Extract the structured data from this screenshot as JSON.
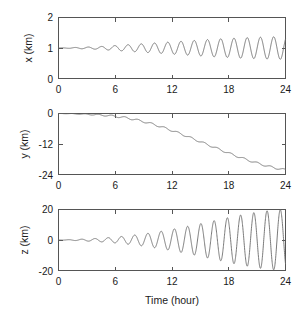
{
  "figure": {
    "background_color": "#ffffff",
    "line_color": "#6b6b6b",
    "axis_color": "#555555",
    "panel_count": 3
  },
  "chart_data": [
    {
      "type": "line",
      "panel_index": 0,
      "title": "",
      "xlabel": "",
      "ylabel": "x (km)",
      "xlim": [
        0,
        24
      ],
      "ylim": [
        0,
        2
      ],
      "xticks": [
        0,
        6,
        12,
        18,
        24
      ],
      "xticklabels": [
        "0",
        "6",
        "12",
        "18",
        "24"
      ],
      "yticks": [
        0,
        1,
        2
      ],
      "yticklabels": [
        "0",
        "1",
        "2"
      ],
      "grid": false,
      "legend": null,
      "description": "Oscillation about x = 1 km with slowly growing amplitude; period about 1.4 hours, amplitude grows from near 0 at t=0 to about 0.35 km at t=24.",
      "series": [
        {
          "name": "x",
          "baseline": 1.0,
          "period_hours": 1.4,
          "amplitude_start": 0.0,
          "amplitude_end": 0.37,
          "growth": "exponential",
          "growth_rate": 0.155,
          "x": [
            0,
            1,
            2,
            3,
            4,
            5,
            6,
            7,
            8,
            9,
            10,
            11,
            12,
            13,
            14,
            15,
            16,
            17,
            18,
            19,
            20,
            21,
            22,
            23,
            24
          ],
          "envelope_upper": [
            1.0,
            1.01,
            1.02,
            1.03,
            1.04,
            1.06,
            1.08,
            1.1,
            1.12,
            1.14,
            1.16,
            1.18,
            1.2,
            1.22,
            1.24,
            1.26,
            1.28,
            1.3,
            1.31,
            1.33,
            1.34,
            1.35,
            1.36,
            1.37,
            1.37
          ],
          "envelope_lower": [
            1.0,
            0.99,
            0.98,
            0.97,
            0.96,
            0.94,
            0.92,
            0.9,
            0.88,
            0.86,
            0.84,
            0.82,
            0.8,
            0.78,
            0.76,
            0.74,
            0.72,
            0.7,
            0.69,
            0.67,
            0.66,
            0.65,
            0.64,
            0.63,
            0.63
          ]
        }
      ]
    },
    {
      "type": "line",
      "panel_index": 1,
      "title": "",
      "xlabel": "",
      "ylabel": "y (km)",
      "xlim": [
        0,
        24
      ],
      "ylim": [
        -24,
        0
      ],
      "xticks": [
        0,
        6,
        12,
        18,
        24
      ],
      "xticklabels": [
        "0",
        "6",
        "12",
        "18",
        "24"
      ],
      "yticks": [
        -24,
        -12,
        0
      ],
      "yticklabels": [
        "-24",
        "-12",
        "0"
      ],
      "grid": false,
      "legend": null,
      "description": "Monotonic accelerating decline from 0 km at t=0 to about -22 km at t=24, with small superimposed ripples of the same period as the x oscillation.",
      "series": [
        {
          "name": "y",
          "x": [
            0,
            1,
            2,
            3,
            4,
            5,
            6,
            7,
            8,
            9,
            10,
            11,
            12,
            13,
            14,
            15,
            16,
            17,
            18,
            19,
            20,
            21,
            22,
            23,
            24
          ],
          "values": [
            0.0,
            -0.05,
            -0.15,
            -0.3,
            -0.5,
            -0.75,
            -1.1,
            -1.6,
            -2.3,
            -3.2,
            -4.2,
            -5.4,
            -6.7,
            -8.1,
            -9.6,
            -11.1,
            -12.6,
            -14.1,
            -15.6,
            -17.0,
            -18.3,
            -19.5,
            -20.6,
            -21.5,
            -22.2
          ],
          "ripple_amplitude": 0.35
        }
      ]
    },
    {
      "type": "line",
      "panel_index": 2,
      "title": "",
      "xlabel": "Time (hour)",
      "ylabel": "z (km)",
      "xlim": [
        0,
        24
      ],
      "ylim": [
        -20,
        20
      ],
      "xticks": [
        0,
        6,
        12,
        18,
        24
      ],
      "xticklabels": [
        "0",
        "6",
        "12",
        "18",
        "24"
      ],
      "yticks": [
        -20,
        0,
        20
      ],
      "yticklabels": [
        "-20",
        "0",
        "20"
      ],
      "grid": false,
      "legend": null,
      "description": "Oscillation about z = 0 km with strongly growing amplitude; period about 1.4 hours, amplitude grows from near 0 at t=0 to about 20 km at t=24.",
      "series": [
        {
          "name": "z",
          "baseline": 0.0,
          "period_hours": 1.4,
          "amplitude_start": 0.0,
          "amplitude_end": 20.0,
          "growth": "exponential",
          "growth_rate": 0.2,
          "x": [
            0,
            1,
            2,
            3,
            4,
            5,
            6,
            7,
            8,
            9,
            10,
            11,
            12,
            13,
            14,
            15,
            16,
            17,
            18,
            19,
            20,
            21,
            22,
            23,
            24
          ],
          "envelope_upper": [
            0.0,
            0.2,
            0.4,
            0.7,
            1.0,
            1.4,
            1.9,
            2.5,
            3.2,
            4.0,
            4.9,
            5.9,
            7.0,
            8.2,
            9.4,
            10.7,
            12.1,
            13.4,
            14.8,
            16.1,
            17.2,
            18.3,
            19.1,
            19.7,
            20.0
          ],
          "envelope_lower": [
            0.0,
            -0.2,
            -0.4,
            -0.7,
            -1.0,
            -1.4,
            -1.9,
            -2.5,
            -3.2,
            -4.0,
            -4.9,
            -5.9,
            -7.0,
            -8.2,
            -9.4,
            -10.7,
            -12.1,
            -13.4,
            -14.8,
            -16.1,
            -17.2,
            -18.3,
            -19.1,
            -19.7,
            -20.0
          ]
        }
      ]
    }
  ],
  "panels": [
    {
      "name": "x-panel",
      "ylabel": "x (km)",
      "ytick_labels": [
        "2",
        "1",
        "0"
      ],
      "xtick_labels": [
        "0",
        "6",
        "12",
        "18",
        "24"
      ],
      "xlabel": ""
    },
    {
      "name": "y-panel",
      "ylabel": "y (km)",
      "ytick_labels": [
        "0",
        "-12",
        "-24"
      ],
      "xtick_labels": [
        "0",
        "6",
        "12",
        "18",
        "24"
      ],
      "xlabel": ""
    },
    {
      "name": "z-panel",
      "ylabel": "z (km)",
      "ytick_labels": [
        "20",
        "0",
        "-20"
      ],
      "xtick_labels": [
        "0",
        "6",
        "12",
        "18",
        "24"
      ],
      "xlabel": "Time (hour)"
    }
  ]
}
